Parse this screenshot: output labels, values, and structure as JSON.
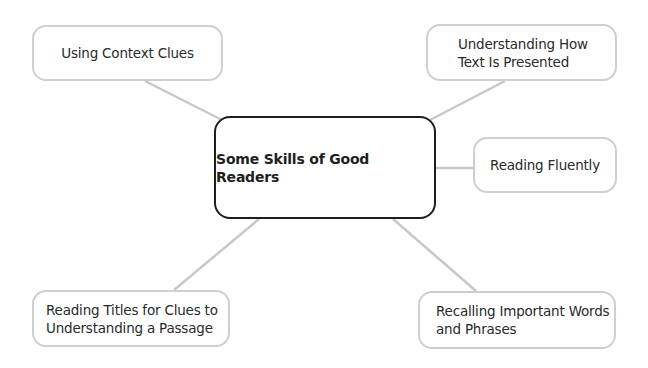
{
  "diagram": {
    "type": "concept-map",
    "center": {
      "label": "Some Skills of Good Readers"
    },
    "nodes": [
      {
        "id": "top-left",
        "label": "Using Context Clues"
      },
      {
        "id": "top-right",
        "label": "Understanding How Text Is Presented"
      },
      {
        "id": "right",
        "label": "Reading Fluently"
      },
      {
        "id": "bottom-left",
        "label": "Reading Titles for Clues to Understanding a Passage"
      },
      {
        "id": "bottom-right",
        "label": "Recalling Important Words and Phrases"
      }
    ],
    "colors": {
      "center_border": "#1e1e1e",
      "node_border": "#cfcfcf",
      "connector": "#c8c8c8",
      "text": "#2a2a2a"
    }
  }
}
